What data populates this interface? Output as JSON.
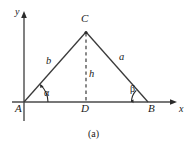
{
  "figure": {
    "caption": "(a)",
    "stroke_color": "#333333",
    "text_color": "#1a1a1a",
    "background": "#ffffff",
    "axes": {
      "y_label": "y",
      "x_label": "x",
      "origin": {
        "x": 24,
        "y": 102
      },
      "x_axis_end": {
        "x": 176,
        "y": 102
      },
      "y_axis_top": {
        "x": 24,
        "y": 13
      },
      "y_axis_bottom": {
        "x": 24,
        "y": 121
      }
    },
    "vertices": [
      {
        "name": "A",
        "label": "A",
        "x": 24,
        "y": 102
      },
      {
        "name": "B",
        "label": "B",
        "x": 148,
        "y": 102
      },
      {
        "name": "C",
        "label": "C",
        "x": 86,
        "y": 32
      },
      {
        "name": "D",
        "label": "D",
        "x": 86,
        "y": 102
      }
    ],
    "sides": [
      {
        "name": "b",
        "label": "b",
        "from": "A",
        "to": "C",
        "style": "solid"
      },
      {
        "name": "a",
        "label": "a",
        "from": "C",
        "to": "B",
        "style": "solid"
      },
      {
        "name": "h",
        "label": "h",
        "from": "C",
        "to": "D",
        "style": "dashed"
      }
    ],
    "angles": [
      {
        "name": "alpha",
        "label": "α",
        "at": "A"
      },
      {
        "name": "beta",
        "label": "β",
        "at": "B"
      }
    ],
    "label_positions": {
      "A": {
        "x": 16,
        "y": 104
      },
      "B": {
        "x": 148,
        "y": 104
      },
      "C": {
        "x": 81,
        "y": 14
      },
      "D": {
        "x": 81,
        "y": 104
      },
      "a": {
        "x": 119,
        "y": 52
      },
      "b": {
        "x": 46,
        "y": 57
      },
      "h": {
        "x": 89,
        "y": 69
      },
      "alpha": {
        "x": 44,
        "y": 89
      },
      "beta": {
        "x": 130,
        "y": 85
      },
      "x": {
        "x": 179,
        "y": 104
      },
      "y": {
        "x": 15,
        "y": 8
      },
      "caption": {
        "x": 88,
        "y": 129
      }
    }
  }
}
